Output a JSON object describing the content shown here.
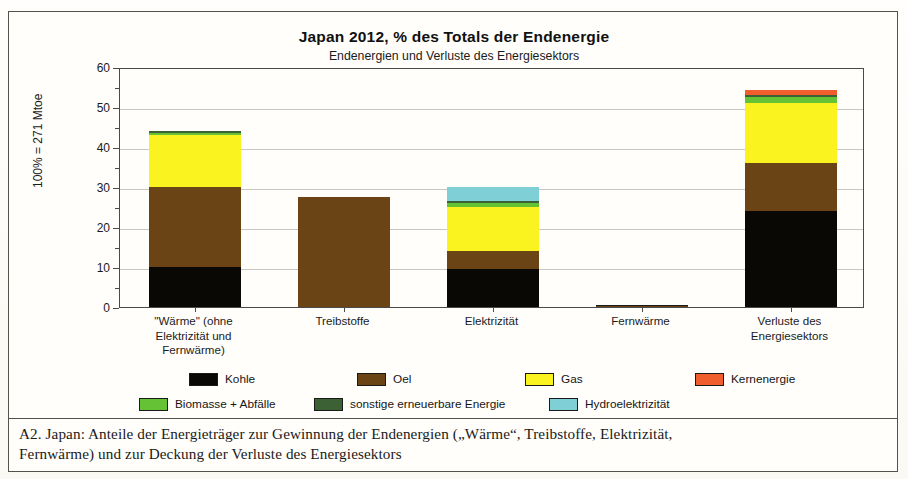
{
  "figure": {
    "title": "Japan  2012,  % des Totals der Endenergie",
    "subtitle": "Endenergien und Verluste des Energiesektors",
    "caption_label": "A2.  Japan:",
    "caption_line1": "Anteile der Energieträger zur Gewinnung der Endenergien („Wärme“, Treibstoffe, Elektrizität,",
    "caption_line2": "Fernwärme) und zur Deckung der Verluste des Energiesektors"
  },
  "chart_data": {
    "type": "bar",
    "title": "Japan  2012,  % des Totals der Endenergie",
    "subtitle": "Endenergien und Verluste des Energiesektors",
    "stacked": true,
    "xlabel": "",
    "ylabel": "100% = 271 Mtoe",
    "ylim": [
      0,
      60
    ],
    "yticks": [
      0,
      10,
      20,
      30,
      40,
      50,
      60
    ],
    "ytick_labels": [
      "0",
      "10",
      "20",
      "30",
      "40",
      "50",
      "60"
    ],
    "minor_ticks": [
      5,
      15,
      25,
      35,
      45,
      55
    ],
    "grid": true,
    "legend_position": "bottom",
    "categories": [
      "\"Wärme\" (ohne Elektrizität und Fernwärme)",
      "Treibstoffe",
      "Elektrizität",
      "Fernwärme",
      "Verluste des Energiesektors"
    ],
    "category_label_lines": [
      [
        "\"Wärme\" (ohne",
        "Elektrizität und",
        "Fernwärme)"
      ],
      [
        "Treibstoffe"
      ],
      [
        "Elektrizität"
      ],
      [
        "Fernwärme"
      ],
      [
        "Verluste des",
        "Energiesektors"
      ]
    ],
    "series": [
      {
        "name": "Kohle",
        "color": "#0a0805",
        "values": [
          10.0,
          0.0,
          9.5,
          0.0,
          24.0
        ]
      },
      {
        "name": "Oel",
        "color": "#6b4415",
        "values": [
          20.0,
          27.5,
          4.5,
          0.3,
          12.0
        ]
      },
      {
        "name": "Gas",
        "color": "#fbf320",
        "values": [
          13.0,
          0.0,
          11.0,
          0.0,
          15.0
        ]
      },
      {
        "name": "Biomasse + Abfälle",
        "color": "#66c235",
        "values": [
          0.6,
          0.0,
          0.9,
          0.0,
          1.6
        ]
      },
      {
        "name": "sonstige erneuerbare Energie",
        "color": "#3b6135",
        "values": [
          0.4,
          0.0,
          0.6,
          0.0,
          0.5
        ]
      },
      {
        "name": "Hydroelektrizität",
        "color": "#7fcfd6",
        "values": [
          0.0,
          0.0,
          3.5,
          0.0,
          0.0
        ]
      },
      {
        "name": "Kernenergie",
        "color": "#ef5e2c",
        "values": [
          0.0,
          0.0,
          0.0,
          0.0,
          1.2
        ]
      }
    ],
    "totals": [
      44.0,
      27.5,
      30.0,
      0.3,
      54.3
    ]
  },
  "legend": {
    "row1": [
      "Kohle",
      "Oel",
      "Gas",
      "Kernenergie"
    ],
    "row2": [
      "Biomasse + Abfälle",
      "sonstige erneuerbare Energie",
      "Hydroelektrizität"
    ],
    "colors": {
      "Kohle": "#0a0805",
      "Oel": "#6b4415",
      "Gas": "#fbf320",
      "Kernenergie": "#ef5e2c",
      "Biomasse + Abfälle": "#66c235",
      "sonstige erneuerbare Energie": "#3b6135",
      "Hydroelektrizität": "#7fcfd6"
    }
  }
}
